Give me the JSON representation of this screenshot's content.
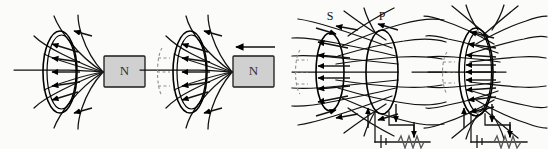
{
  "figure": {
    "background_color": "#fbfbfa",
    "ink_color": "#111111",
    "magnet_fill_color": "#d0d0d0",
    "panel_count": 4
  },
  "panels": [
    {
      "id": "panel-1",
      "caption": "",
      "magnet": {
        "label": "N",
        "moving": false,
        "motion_arrow": ""
      },
      "coils": [
        {
          "label": "",
          "name": "coil"
        }
      ],
      "circuit": {
        "present": false
      }
    },
    {
      "id": "panel-2",
      "caption": "",
      "magnet": {
        "label": "N",
        "moving": true,
        "motion_arrow": "left"
      },
      "coils": [
        {
          "label": "",
          "name": "coil"
        }
      ],
      "ghost_outline": true,
      "circuit": {
        "present": false
      }
    },
    {
      "id": "panel-3",
      "caption": "",
      "coils": [
        {
          "label": "S",
          "name": "secondary-coil"
        },
        {
          "label": "P",
          "name": "primary-coil"
        }
      ],
      "ghost_outline": true,
      "circuit": {
        "present": true,
        "battery_symbol": "cell",
        "resistor_symbol": "zigzag",
        "current_arrows": [
          "up",
          "down",
          "down"
        ]
      }
    },
    {
      "id": "panel-4",
      "caption": "",
      "coils": [
        {
          "label": "",
          "name": "secondary-coil"
        },
        {
          "label": "",
          "name": "primary-coil"
        }
      ],
      "ghost_outline": true,
      "circuit": {
        "present": true,
        "battery_symbol": "cell",
        "resistor_symbol": "zigzag",
        "current_arrows": [
          "up",
          "down",
          "down"
        ]
      }
    }
  ],
  "labels": {
    "magnet_north": "N",
    "secondary": "S",
    "primary": "P"
  }
}
